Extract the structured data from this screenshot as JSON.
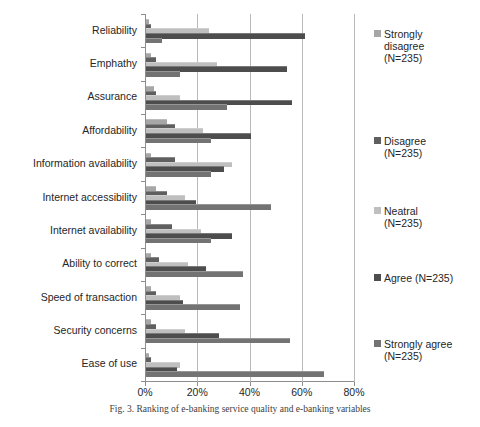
{
  "figure": {
    "caption": "Fig. 3.  Ranking of e-banking service quality and e-banking variables"
  },
  "axis": {
    "x_ticks": [
      "0%",
      "20%",
      "40%",
      "60%",
      "80%"
    ],
    "x_tick_values": [
      0,
      20,
      40,
      60,
      80
    ],
    "x_min": 0,
    "x_max": 80
  },
  "legend": {
    "position": "right",
    "items": [
      {
        "label": "Strongly disagree (N=235)",
        "line1": "Strongly",
        "line2": "disagree",
        "line3": "(N=235)",
        "color": "#a6a6a6"
      },
      {
        "label": "Disagree (N=235)",
        "line1": "Disagree",
        "line2": "(N=235)",
        "line3": "",
        "color": "#5f5f5f"
      },
      {
        "label": "Neatral (N=235)",
        "line1": "Neatral",
        "line2": "(N=235)",
        "line3": "",
        "color": "#bfbfbf"
      },
      {
        "label": "Agree (N=235)",
        "line1": "Agree (N=235)",
        "line2": "",
        "line3": "",
        "color": "#4d4d4d"
      },
      {
        "label": "Strongly agree (N=235)",
        "line1": "Strongly agree",
        "line2": "(N=235)",
        "line3": "",
        "color": "#737373"
      }
    ]
  },
  "chart_data": {
    "type": "bar",
    "orientation": "horizontal",
    "title": "",
    "xlabel": "",
    "ylabel": "",
    "xlim": [
      0,
      80
    ],
    "grid": true,
    "legend_position": "right",
    "categories": [
      "Reliability",
      "Emphathy",
      "Assurance",
      "Affordability",
      "Information availability",
      "Internet accessibility",
      "Internet availability",
      "Ability to correct",
      "Speed of transaction",
      "Security concerns",
      "Ease of use"
    ],
    "series": [
      {
        "name": "Strongly disagree (N=235)",
        "color": "#a6a6a6",
        "values": [
          1,
          2,
          3,
          8,
          2,
          4,
          2,
          2,
          2,
          2,
          1
        ]
      },
      {
        "name": "Disagree (N=235)",
        "color": "#5f5f5f",
        "values": [
          2,
          4,
          4,
          11,
          11,
          8,
          10,
          5,
          4,
          4,
          2
        ]
      },
      {
        "name": "Neatral (N=235)",
        "color": "#bfbfbf",
        "values": [
          24,
          27,
          13,
          22,
          33,
          15,
          21,
          16,
          13,
          15,
          13
        ]
      },
      {
        "name": "Agree (N=235)",
        "color": "#4d4d4d",
        "values": [
          61,
          54,
          56,
          40,
          30,
          19,
          33,
          23,
          14,
          28,
          12
        ]
      },
      {
        "name": "Strongly agree (N=235)",
        "color": "#737373",
        "values": [
          6,
          13,
          31,
          25,
          25,
          48,
          25,
          37,
          36,
          55,
          68
        ]
      }
    ]
  }
}
